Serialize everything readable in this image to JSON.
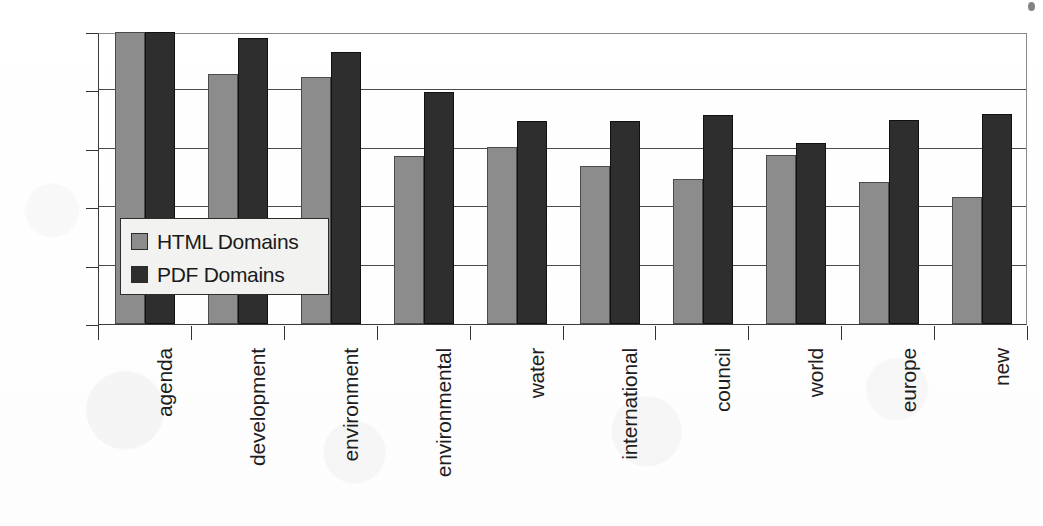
{
  "chart_data": {
    "type": "bar",
    "title": "",
    "subtitle": "",
    "xlabel": "",
    "ylabel": "",
    "ylim": [
      0,
      100
    ],
    "y_unit": "%",
    "grid": true,
    "legend_position": "inside-left",
    "orientation": "vertical",
    "categories": [
      "agenda",
      "development",
      "environment",
      "environmental",
      "water",
      "international",
      "council",
      "world",
      "europe",
      "new"
    ],
    "series": [
      {
        "name": "HTML Domains",
        "color": "#8c8c8c",
        "values": [
          100,
          85.5,
          84.5,
          57.5,
          60.5,
          54,
          49.5,
          58,
          48.5,
          43.5
        ]
      },
      {
        "name": "PDF Domains",
        "color": "#2e2e2e",
        "values": [
          100,
          98,
          93,
          79.5,
          69.5,
          69.5,
          71.5,
          62,
          70,
          72
        ]
      }
    ],
    "y_ticks": [
      "0%",
      "20%",
      "40%",
      "60%",
      "80%",
      "100%"
    ],
    "y_tick_values": [
      0,
      20,
      40,
      60,
      80,
      100
    ]
  },
  "legend": {
    "items": [
      {
        "label": "HTML Domains",
        "color": "#8c8c8c"
      },
      {
        "label": "PDF Domains",
        "color": "#2e2e2e"
      }
    ]
  },
  "colors": {
    "html_series": "#8c8c8c",
    "pdf_series": "#2e2e2e",
    "axis": "#333333",
    "grid": "#4a4a4a",
    "legend_background": "#f2f2f0"
  }
}
